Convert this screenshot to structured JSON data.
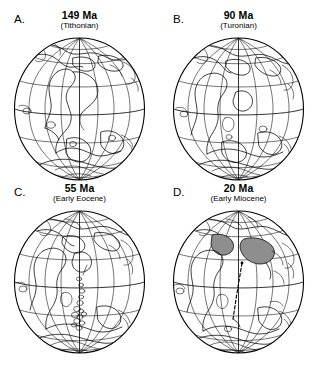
{
  "figure": {
    "running_head": "",
    "type": "paleogeographic-reconstruction-globes",
    "projection": "orthographic",
    "graticule_interval_deg": 30
  },
  "panels": [
    {
      "letter": "A.",
      "age": "149 Ma",
      "stage": "(Tithonian)",
      "name": "panel-a"
    },
    {
      "letter": "B.",
      "age": "90 Ma",
      "stage": "(Turonian)",
      "name": "panel-b"
    },
    {
      "letter": "C.",
      "age": "55 Ma",
      "stage": "(Early Eocene)",
      "name": "panel-c"
    },
    {
      "letter": "D.",
      "age": "20 Ma",
      "stage": "(Early Miocene)",
      "name": "panel-d"
    }
  ]
}
